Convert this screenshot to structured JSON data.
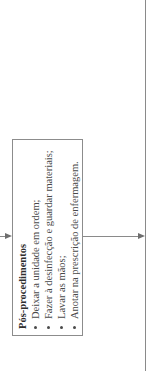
{
  "box": {
    "title": "Pós-procedimentos",
    "items": [
      "Deixar a unidade em ordem;",
      "Fazer à desinfecção e guardar materiais;",
      "Lavar as mãos;",
      "Anotar na prescrição de enfermagem."
    ]
  },
  "colors": {
    "line": "#8a8a8a",
    "text": "#3a3a3a",
    "background": "#ffffff"
  }
}
